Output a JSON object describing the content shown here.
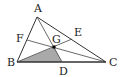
{
  "diagram": {
    "type": "triangle-with-cevians",
    "colors": {
      "stroke": "#333333",
      "shade": "#a9a9a9",
      "point": "#000000",
      "label": "#222222"
    },
    "points": {
      "A": {
        "label": "A",
        "x": 37,
        "y": 17
      },
      "B": {
        "label": "B",
        "x": 17,
        "y": 62
      },
      "C": {
        "label": "C",
        "x": 106,
        "y": 62
      },
      "D": {
        "label": "D",
        "x": 62,
        "y": 62
      },
      "E": {
        "label": "E",
        "x": 72,
        "y": 39
      },
      "F": {
        "label": "F",
        "x": 27,
        "y": 40
      },
      "G": {
        "label": "G",
        "x": 54,
        "y": 47
      }
    },
    "segments": [
      "AB",
      "BC",
      "CA",
      "AD",
      "BE",
      "CF"
    ],
    "shaded_region": [
      "B",
      "G",
      "D"
    ],
    "labels": {
      "A": "A",
      "B": "B",
      "C": "C",
      "D": "D",
      "E": "E",
      "F": "F",
      "G": "G"
    }
  }
}
